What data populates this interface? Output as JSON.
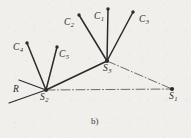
{
  "figure": {
    "caption": "b)",
    "background_color": "#f1efeb",
    "ink_color": "#2b2b2b"
  },
  "labels": {
    "c1": {
      "base": "C",
      "sub": "1",
      "x": 94,
      "y": 12
    },
    "c2": {
      "base": "C",
      "sub": "2",
      "x": 64,
      "y": 18
    },
    "c3": {
      "base": "C",
      "sub": "3",
      "x": 139,
      "y": 15
    },
    "c4": {
      "base": "C",
      "sub": "4",
      "x": 13,
      "y": 43
    },
    "c5": {
      "base": "C",
      "sub": "5",
      "x": 59,
      "y": 50
    },
    "s1": {
      "base": "S",
      "sub": "1",
      "x": 169,
      "y": 92
    },
    "s2": {
      "base": "S",
      "sub": "2",
      "x": 40,
      "y": 93
    },
    "s3": {
      "base": "S",
      "sub": "3",
      "x": 103,
      "y": 64
    },
    "r": {
      "base": "R",
      "sub": "",
      "x": 13,
      "y": 85
    }
  },
  "chart_data": {
    "type": "diagram",
    "title": "b)",
    "nodes": [
      {
        "id": "C1",
        "label": "C1",
        "x": 108,
        "y": 9,
        "kind": "client-dot"
      },
      {
        "id": "C2",
        "label": "C2",
        "x": 79,
        "y": 15,
        "kind": "client-dot"
      },
      {
        "id": "C3",
        "label": "C3",
        "x": 133,
        "y": 12,
        "kind": "client-dot"
      },
      {
        "id": "C4",
        "label": "C4",
        "x": 27,
        "y": 43,
        "kind": "client-dot"
      },
      {
        "id": "C5",
        "label": "C5",
        "x": 57,
        "y": 47,
        "kind": "client-dot"
      },
      {
        "id": "S1",
        "label": "S1",
        "x": 172,
        "y": 89,
        "kind": "station"
      },
      {
        "id": "S2",
        "label": "S2",
        "x": 46,
        "y": 90,
        "kind": "station"
      },
      {
        "id": "S3",
        "label": "S3",
        "x": 107,
        "y": 61,
        "kind": "station"
      },
      {
        "id": "R",
        "label": "R",
        "x": 19,
        "y": 80,
        "kind": "endpoint"
      }
    ],
    "edges": [
      {
        "from": "C1",
        "to": "S3",
        "style": "solid",
        "width": 1.5
      },
      {
        "from": "C2",
        "to": "S3",
        "style": "solid",
        "width": 1.5
      },
      {
        "from": "C3",
        "to": "S3",
        "style": "solid",
        "width": 1.5
      },
      {
        "from": "C4",
        "to": "S2",
        "style": "solid",
        "width": 1.5
      },
      {
        "from": "C5",
        "to": "S2",
        "style": "solid",
        "width": 1.5
      },
      {
        "from": "S2",
        "to": "S3",
        "style": "solid",
        "width": 1.6
      },
      {
        "from": "S2",
        "to": "S1",
        "style": "dash-dot",
        "width": 0.8
      },
      {
        "from": "S3",
        "to": "S1",
        "style": "dash-dot",
        "width": 0.8
      },
      {
        "from": "R",
        "to": "S2",
        "style": "solid",
        "width": 1.2
      }
    ],
    "r_tail": {
      "x1": 46,
      "y1": 90,
      "x2": 9,
      "y2": 103,
      "style": "solid"
    }
  }
}
